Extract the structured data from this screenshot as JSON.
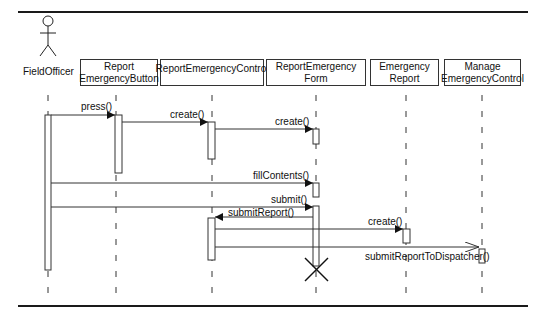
{
  "diagram": {
    "type": "UML sequence diagram",
    "actor": {
      "name": "FieldOfficer"
    },
    "objects": [
      {
        "id": "button",
        "line1": "Report",
        "line2": "EmergencyButton"
      },
      {
        "id": "control",
        "line1": "ReportEmergencyControl",
        "line2": ""
      },
      {
        "id": "form",
        "line1": "ReportEmergency",
        "line2": "Form"
      },
      {
        "id": "report",
        "line1": "Emergency",
        "line2": "Report"
      },
      {
        "id": "manage",
        "line1": "Manage",
        "line2": "EmergencyControl"
      }
    ],
    "messages": [
      {
        "from": "FieldOfficer",
        "to": "ReportEmergencyButton",
        "label": "press()"
      },
      {
        "from": "ReportEmergencyButton",
        "to": "ReportEmergencyControl",
        "label": "create()"
      },
      {
        "from": "ReportEmergencyControl",
        "to": "ReportEmergencyForm",
        "label": "create()"
      },
      {
        "from": "FieldOfficer",
        "to": "ReportEmergencyForm",
        "label": "fillContents()"
      },
      {
        "from": "FieldOfficer",
        "to": "ReportEmergencyForm",
        "label": "submit()"
      },
      {
        "from": "ReportEmergencyForm",
        "to": "ReportEmergencyControl",
        "label": "submitReport()"
      },
      {
        "from": "ReportEmergencyControl",
        "to": "EmergencyReport",
        "label": "create()"
      },
      {
        "from": "ReportEmergencyControl",
        "to": "ManageEmergencyControl",
        "label": "submitReportToDispatcher()",
        "async": true
      }
    ],
    "destroyed": "ReportEmergencyForm"
  }
}
